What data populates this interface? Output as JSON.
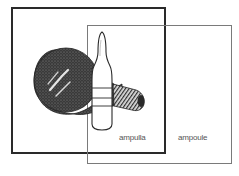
{
  "diagram": {
    "type": "overlapping-squares-comparison",
    "squares": [
      {
        "id": "ampulla",
        "label": "ampulla",
        "border_style": "thick",
        "border_color": "#2a2a2a",
        "contains": "lightbulb-illustration"
      },
      {
        "id": "ampoule",
        "label": "ampoule",
        "border_style": "thin",
        "border_color": "#7a7a7a",
        "contains": "ampoule-vial-illustration"
      }
    ],
    "icons": {
      "lightbulb": "lightbulb-icon",
      "vial": "ampoule-vial-icon"
    }
  }
}
